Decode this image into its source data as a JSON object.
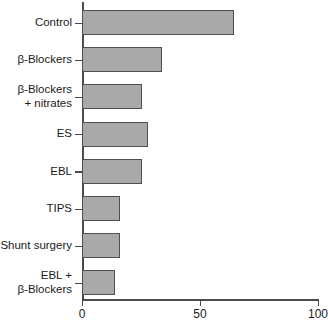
{
  "chart_data": {
    "type": "bar",
    "orientation": "horizontal",
    "title": "",
    "subtitle": "",
    "xlabel": "",
    "ylabel": "",
    "categories": [
      "Control",
      "β-Blockers",
      "β-Blockers\n+ nitrates",
      "ES",
      "EBL",
      "TIPS",
      "Shunt surgery",
      "EBL +\nβ-Blockers"
    ],
    "values": [
      64.5,
      34,
      25.5,
      28,
      25.5,
      16,
      16,
      14
    ],
    "xlim": [
      0,
      100
    ],
    "xticks": [
      0,
      50,
      100
    ],
    "xticklabels": [
      "0",
      "50",
      "100"
    ],
    "grid": false,
    "legend": null,
    "bar_color": "#a9a9a9",
    "bar_border_color": "#4f4f4f",
    "axis_color": "#4a4a4a",
    "text_color": "#1a1a1a"
  }
}
